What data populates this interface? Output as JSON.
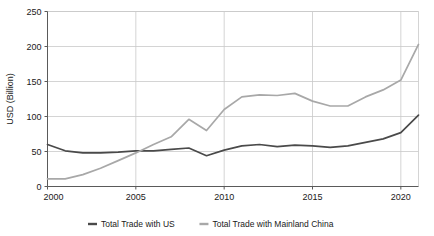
{
  "chart_data": {
    "type": "line",
    "title": "",
    "xlabel": "",
    "ylabel": "USD (Billion)",
    "xlim": [
      2000,
      2021
    ],
    "ylim": [
      0,
      250
    ],
    "grid": true,
    "legend_position": "bottom",
    "x": [
      2000,
      2001,
      2002,
      2003,
      2004,
      2005,
      2006,
      2007,
      2008,
      2009,
      2010,
      2011,
      2012,
      2013,
      2014,
      2015,
      2016,
      2017,
      2018,
      2019,
      2020,
      2021
    ],
    "xticks": [
      "2000",
      "2005",
      "2010",
      "2015",
      "2020"
    ],
    "xtick_values": [
      2000,
      2005,
      2010,
      2015,
      2020
    ],
    "yticks": [
      "0",
      "50",
      "100",
      "150",
      "200",
      "250"
    ],
    "ytick_values": [
      0,
      50,
      100,
      150,
      200,
      250
    ],
    "series": [
      {
        "name": "Total Trade with US",
        "color": "#4a4a4a",
        "values": [
          60,
          51,
          48,
          48,
          49,
          51,
          51,
          53,
          55,
          44,
          52,
          58,
          60,
          57,
          59,
          58,
          56,
          58,
          63,
          68,
          77,
          102
        ]
      },
      {
        "name": "Total Trade with Mainland China",
        "color": "#a8a8a8",
        "values": [
          11,
          11,
          17,
          26,
          37,
          48,
          60,
          71,
          96,
          80,
          110,
          128,
          131,
          130,
          133,
          122,
          115,
          115,
          128,
          138,
          152,
          203
        ]
      }
    ]
  },
  "legend": {
    "items": [
      {
        "label": "Total Trade with US",
        "color": "#4a4a4a"
      },
      {
        "label": "Total Trade with Mainland China",
        "color": "#a8a8a8"
      }
    ]
  },
  "axes": {
    "y_title": "USD (Billion)"
  }
}
